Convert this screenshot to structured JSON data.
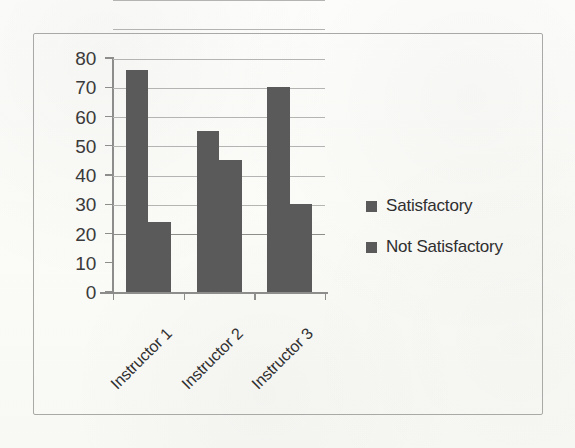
{
  "chart_data": {
    "type": "bar",
    "title": "",
    "subtitle": "",
    "xlabel": "",
    "ylabel": "",
    "categories": [
      "Instructor 1",
      "Instructor 2",
      "Instructor 3"
    ],
    "series": [
      {
        "name": "Satisfactory",
        "values": [
          76,
          55,
          70
        ],
        "color": "#5a5a5a"
      },
      {
        "name": "Not Satisfactory",
        "values": [
          24,
          45,
          30
        ],
        "color": "#5a5a5a"
      }
    ],
    "ylim": [
      0,
      80
    ],
    "ytick_step": 10,
    "yticks": [
      0,
      10,
      20,
      30,
      40,
      50,
      60,
      70,
      80
    ],
    "ytick_labels": [
      "0",
      "10",
      "20",
      "30",
      "40",
      "50",
      "60",
      "70",
      "80"
    ],
    "grid": true,
    "grid_axis": "y",
    "legend_position": "right",
    "bar_gap_within_group": 0,
    "xtick_label_rotation": -45
  },
  "legend": {
    "entries": [
      {
        "label": "Satisfactory"
      },
      {
        "label": "Not Satisfactory"
      }
    ]
  },
  "colors": {
    "bar": "#5a5a5a",
    "gridline": "#b4b4b2",
    "axis": "#8d8d8b",
    "frame": "#a9a9a7",
    "text": "#2f2f2f",
    "paper": "#fdfdfb"
  }
}
